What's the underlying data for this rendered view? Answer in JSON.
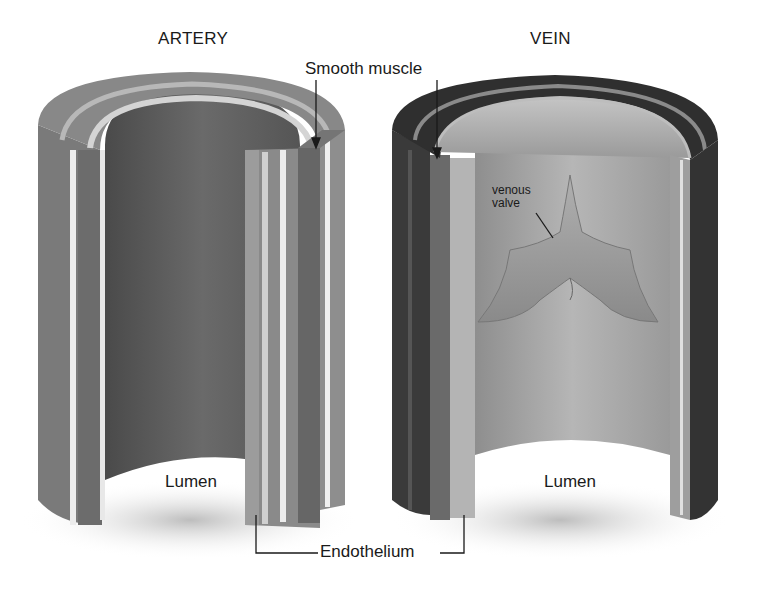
{
  "diagram": {
    "vessels": [
      {
        "id": "artery",
        "title": "ARTERY",
        "lumen_label": "Lumen"
      },
      {
        "id": "vein",
        "title": "VEIN",
        "lumen_label": "Lumen"
      }
    ],
    "callouts": {
      "smooth_muscle": "Smooth muscle",
      "venous_valve_line1": "venous",
      "venous_valve_line2": "valve",
      "endothelium": "Endothelium"
    },
    "colors": {
      "background": "#ffffff",
      "artery_outer": "#7a7a7a",
      "artery_lumen": "#5e5e5e",
      "vein_outer": "#3a3a3a",
      "vein_lumen": "#a8a8a8",
      "endothelium_stripe": "#e6e6e6",
      "label_text": "#1a1a1a"
    }
  }
}
